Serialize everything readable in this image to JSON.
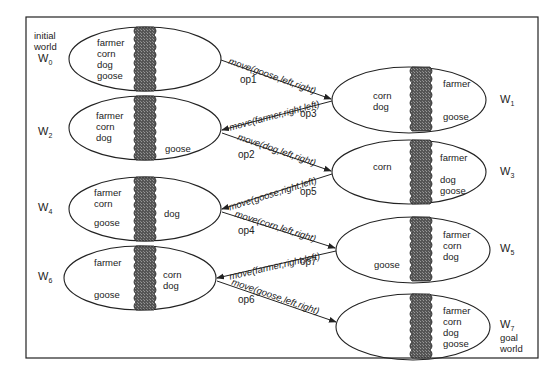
{
  "diagram": {
    "type": "state-space search (farmer, corn, dog, goose river crossing)",
    "initial_label": "initial\nworld",
    "goal_label": "goal\nworld",
    "worlds": [
      {
        "id": "W0",
        "name": "W",
        "sub": "0",
        "left": [
          "farmer",
          "corn",
          "dog",
          "goose"
        ],
        "right": []
      },
      {
        "id": "W1",
        "name": "W",
        "sub": "1",
        "left": [
          "corn",
          "dog"
        ],
        "right": [
          "farmer",
          "goose"
        ]
      },
      {
        "id": "W2",
        "name": "W",
        "sub": "2",
        "left": [
          "farmer",
          "corn",
          "dog"
        ],
        "right": [
          "goose"
        ]
      },
      {
        "id": "W3",
        "name": "W",
        "sub": "3",
        "left": [
          "corn"
        ],
        "right": [
          "farmer",
          "dog",
          "goose"
        ]
      },
      {
        "id": "W4",
        "name": "W",
        "sub": "4",
        "left": [
          "farmer",
          "corn",
          "goose"
        ],
        "right": [
          "dog"
        ]
      },
      {
        "id": "W5",
        "name": "W",
        "sub": "5",
        "left": [
          "goose"
        ],
        "right": [
          "farmer",
          "corn",
          "dog"
        ]
      },
      {
        "id": "W6",
        "name": "W",
        "sub": "6",
        "left": [
          "farmer",
          "goose"
        ],
        "right": [
          "corn",
          "dog"
        ]
      },
      {
        "id": "W7",
        "name": "W",
        "sub": "7",
        "left": [],
        "right": [
          "farmer",
          "corn",
          "dog",
          "goose"
        ]
      }
    ],
    "operators": [
      {
        "op": "op1",
        "label": "move(goose,left,right)",
        "from": "W0",
        "to": "W1"
      },
      {
        "op": "op3",
        "label": "move(farmer,right,left)",
        "from": "W1",
        "to": "W2"
      },
      {
        "op": "op2",
        "label": "move(dog,left,right)",
        "from": "W2",
        "to": "W3"
      },
      {
        "op": "op5",
        "label": "move(goose,right,left)",
        "from": "W3",
        "to": "W4"
      },
      {
        "op": "op4",
        "label": "move(corn,left,right)",
        "from": "W4",
        "to": "W5"
      },
      {
        "op": "op7",
        "label": "move(farmer,right,left)",
        "from": "W5",
        "to": "W6"
      },
      {
        "op": "op6",
        "label": "move(goose,left,right)",
        "from": "W6",
        "to": "W7"
      }
    ]
  }
}
